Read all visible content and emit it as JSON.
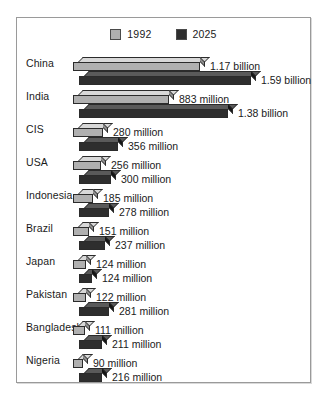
{
  "legend": {
    "items": [
      {
        "label": "1992",
        "swatch_color": "#b0b0b0",
        "icon": "legend-swatch-light"
      },
      {
        "label": "2025",
        "swatch_color": "#2e2e2e",
        "icon": "legend-swatch-dark"
      }
    ]
  },
  "chart_data": {
    "type": "bar",
    "orientation": "horizontal",
    "style": "3d-bar",
    "title": "",
    "subtitle": "",
    "xlabel": "",
    "ylabel": "",
    "grid": false,
    "legend_position": "top-center",
    "unit": "people",
    "value_scale_max_millions": 1590,
    "categories": [
      "China",
      "India",
      "CIS",
      "USA",
      "Indonesia",
      "Brazil",
      "Japan",
      "Pakistan",
      "Bangladesh",
      "Nigeria"
    ],
    "series": [
      {
        "name": "1992",
        "color": "#b0b0b0",
        "values": [
          1170,
          883,
          280,
          256,
          185,
          151,
          124,
          122,
          111,
          90
        ],
        "labels": [
          "1.17 billion",
          "883 million",
          "280 million",
          "256 million",
          "185 million",
          "151 million",
          "124 million",
          "122 million",
          "111 million",
          "90 million"
        ]
      },
      {
        "name": "2025",
        "color": "#2e2e2e",
        "values": [
          1590,
          1380,
          356,
          300,
          278,
          237,
          124,
          281,
          211,
          216
        ],
        "labels": [
          "1.59 billion",
          "1.38 billion",
          "356 million",
          "300 million",
          "278 million",
          "237 million",
          "124 million",
          "281 million",
          "211 million",
          "216 million"
        ]
      }
    ]
  }
}
